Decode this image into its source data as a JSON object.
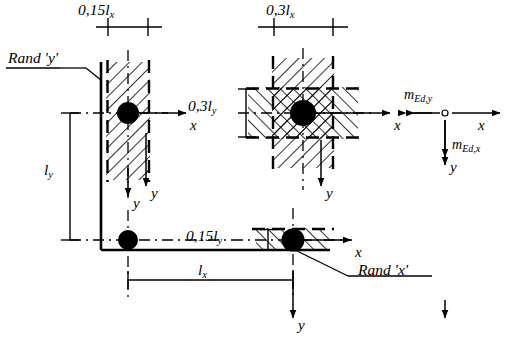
{
  "figure": {
    "type": "engineering-diagram",
    "background_color": "#ffffff",
    "line_color": "#000000",
    "hatch_color": "#000000"
  },
  "dimension_labels": {
    "top_left": "0,15lₓ",
    "top_right": "0,3lₓ",
    "mid_right": "0,3lᵧ",
    "bottom_mid": "0,15lᵧ",
    "left_height": "lᵧ",
    "bottom_width": "lₓ"
  },
  "dim_parts": {
    "top_left_main": "0,15l",
    "top_left_sub": "x",
    "top_right_main": "0,3l",
    "top_right_sub": "x",
    "mid_right_main": "0,3l",
    "mid_right_sub": "y",
    "bottom_mid_main": "0,15l",
    "bottom_mid_sub": "y",
    "left_height_main": "l",
    "left_height_sub": "y",
    "bottom_width_main": "l",
    "bottom_width_sub": "x"
  },
  "edge_callouts": {
    "edge_y": "Rand 'y'",
    "edge_x": "Rand 'x'"
  },
  "axis_labels": {
    "x_edge_y_column": "x",
    "y_edge_y_column": "y",
    "x_interior_column": "x",
    "y_interior_column": "y",
    "x_edge_x_column": "x",
    "y_edge_x_column": "y",
    "x_moment_detail": "x",
    "y_moment_detail": "y",
    "y_left_corner": "y"
  },
  "moment_detail": {
    "moment_y_main": "m",
    "moment_y_sub": "Ed,y",
    "moment_x_main": "m",
    "moment_x_sub": "Ed,x",
    "moment_y_full": "mₑd,y",
    "moment_x_full": "mₑd,x"
  },
  "columns": [
    {
      "name": "edge-column-y",
      "strip": "vertical",
      "hatch": "single-diagonal"
    },
    {
      "name": "interior-column",
      "strip": "cross",
      "hatch": "cross-diagonal"
    },
    {
      "name": "edge-column-x",
      "strip": "horizontal",
      "hatch": "single-diagonal"
    },
    {
      "name": "corner-column",
      "strip": "none",
      "hatch": "none"
    }
  ]
}
